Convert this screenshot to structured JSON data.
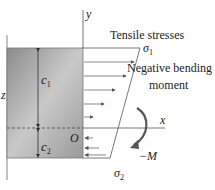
{
  "diagram": {
    "labels": {
      "y_axis": "y",
      "x_axis": "x",
      "origin": "O",
      "c1": "c",
      "c1_sub": "1",
      "c2": "c",
      "c2_sub": "2",
      "z_axis": "z",
      "tensile": "Tensile stresses",
      "sigma1": "σ",
      "sigma1_sub": "1",
      "sigma2": "σ",
      "sigma2_sub": "2",
      "neg_bending_1": "Negative bending",
      "neg_bending_2": "moment",
      "moment": "−M"
    },
    "colors": {
      "beam_dark": "#8a8a8a",
      "beam_light": "#c8c8c8",
      "line": "#555555",
      "moment_arrow": "#555555"
    }
  }
}
